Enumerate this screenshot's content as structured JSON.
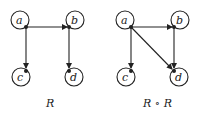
{
  "diagrams": [
    {
      "caption": "R",
      "nodes": [
        {
          "id": "a",
          "label": "a"
        },
        {
          "id": "b",
          "label": "b"
        },
        {
          "id": "c",
          "label": "c"
        },
        {
          "id": "d",
          "label": "d"
        }
      ],
      "edges": [
        {
          "from": "a",
          "to": "a"
        },
        {
          "from": "b",
          "to": "b"
        },
        {
          "from": "c",
          "to": "c"
        },
        {
          "from": "d",
          "to": "d"
        },
        {
          "from": "a",
          "to": "b"
        },
        {
          "from": "a",
          "to": "c"
        },
        {
          "from": "b",
          "to": "d"
        }
      ]
    },
    {
      "caption": "R ∘ R",
      "nodes": [
        {
          "id": "a",
          "label": "a"
        },
        {
          "id": "b",
          "label": "b"
        },
        {
          "id": "c",
          "label": "c"
        },
        {
          "id": "d",
          "label": "d"
        }
      ],
      "edges": [
        {
          "from": "a",
          "to": "a"
        },
        {
          "from": "b",
          "to": "b"
        },
        {
          "from": "c",
          "to": "c"
        },
        {
          "from": "d",
          "to": "d"
        },
        {
          "from": "a",
          "to": "b"
        },
        {
          "from": "a",
          "to": "c"
        },
        {
          "from": "b",
          "to": "d"
        },
        {
          "from": "a",
          "to": "d"
        }
      ]
    }
  ],
  "colors": {
    "stroke": "#222222",
    "background": "#ffffff"
  }
}
